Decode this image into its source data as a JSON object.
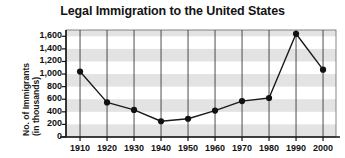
{
  "chart_data": {
    "type": "line",
    "title": "Legal Immigration to the United States",
    "xlabel": "",
    "ylabel": "No. of Immigrants (in thousands)",
    "ylabel_line1": "No. of Immigrants",
    "ylabel_line2": "(in thousands)",
    "categories": [
      "1910",
      "1920",
      "1930",
      "1940",
      "1950",
      "1960",
      "1970",
      "1980",
      "1990",
      "2000"
    ],
    "x": [
      1910,
      1920,
      1930,
      1940,
      1950,
      1960,
      1970,
      1980,
      1990,
      2000
    ],
    "values": [
      1040,
      550,
      430,
      250,
      290,
      420,
      570,
      620,
      1640,
      1070
    ],
    "series": [
      {
        "name": "No. of Immigrants (in thousands)",
        "values": [
          1040,
          550,
          430,
          250,
          290,
          420,
          570,
          620,
          1640,
          1070
        ]
      }
    ],
    "ylim": [
      0,
      1700
    ],
    "yticks": [
      0,
      200,
      400,
      600,
      800,
      1000,
      1200,
      1400,
      1600
    ],
    "ytick_labels": [
      "0",
      "200",
      "400",
      "600",
      "800",
      "1,000",
      "1,200",
      "1,400",
      "1,600"
    ],
    "grid": "vertical-gridlines-and-horizontal-bands",
    "legend": "none",
    "marker": "filled-circle",
    "line_color": "#1a1a1a",
    "marker_color": "#111111",
    "band_color": "#e3e3e3",
    "plot_background": "#ffffff",
    "axis_color": "#141414"
  }
}
